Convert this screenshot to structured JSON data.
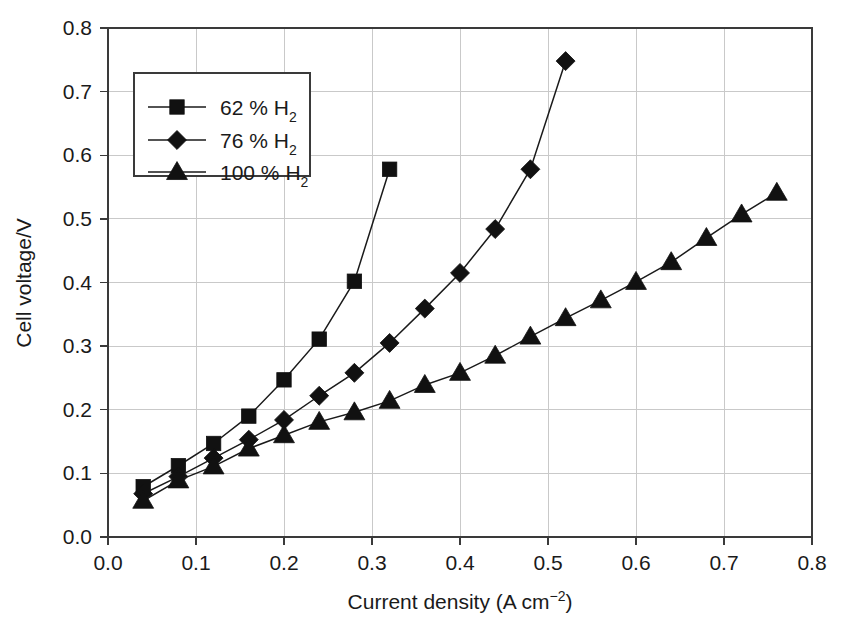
{
  "chart_data": {
    "type": "line",
    "title": "",
    "xlabel": "Current density (A cm⁻²)",
    "ylabel": "Cell voltage/V",
    "xlim": [
      0.0,
      0.8
    ],
    "ylim": [
      0.0,
      0.8
    ],
    "xticks": [
      "0.0",
      "0.1",
      "0.2",
      "0.3",
      "0.4",
      "0.5",
      "0.6",
      "0.7",
      "0.8"
    ],
    "yticks": [
      "0.0",
      "0.1",
      "0.2",
      "0.3",
      "0.4",
      "0.5",
      "0.6",
      "0.7",
      "0.8"
    ],
    "grid": true,
    "legend_position": "upper-left",
    "series": [
      {
        "name": "62 % H2",
        "label_main": "62 % H",
        "label_sub": "2",
        "marker": "square",
        "x": [
          0.04,
          0.08,
          0.12,
          0.16,
          0.2,
          0.24,
          0.28,
          0.32
        ],
        "values": [
          0.079,
          0.112,
          0.147,
          0.19,
          0.247,
          0.311,
          0.402,
          0.578
        ]
      },
      {
        "name": "76 % H2",
        "label_main": "76 % H",
        "label_sub": "2",
        "marker": "diamond",
        "x": [
          0.04,
          0.08,
          0.12,
          0.16,
          0.2,
          0.24,
          0.28,
          0.32,
          0.36,
          0.4,
          0.44,
          0.48,
          0.52
        ],
        "values": [
          0.068,
          0.095,
          0.124,
          0.153,
          0.184,
          0.222,
          0.258,
          0.305,
          0.359,
          0.415,
          0.484,
          0.578,
          0.748
        ]
      },
      {
        "name": "100 % H2",
        "label_main": "100 % H",
        "label_sub": "2",
        "marker": "triangle",
        "x": [
          0.04,
          0.08,
          0.12,
          0.16,
          0.2,
          0.24,
          0.28,
          0.32,
          0.36,
          0.4,
          0.44,
          0.48,
          0.52,
          0.56,
          0.6,
          0.64,
          0.68,
          0.72,
          0.76
        ],
        "values": [
          0.057,
          0.089,
          0.111,
          0.139,
          0.16,
          0.181,
          0.196,
          0.214,
          0.239,
          0.258,
          0.285,
          0.315,
          0.344,
          0.372,
          0.401,
          0.432,
          0.47,
          0.507,
          0.541
        ]
      }
    ]
  },
  "axes": {
    "x_title_main": "Current density (A cm",
    "x_title_sup": "−2",
    "x_title_end": ")",
    "y_title": "Cell voltage/V"
  }
}
